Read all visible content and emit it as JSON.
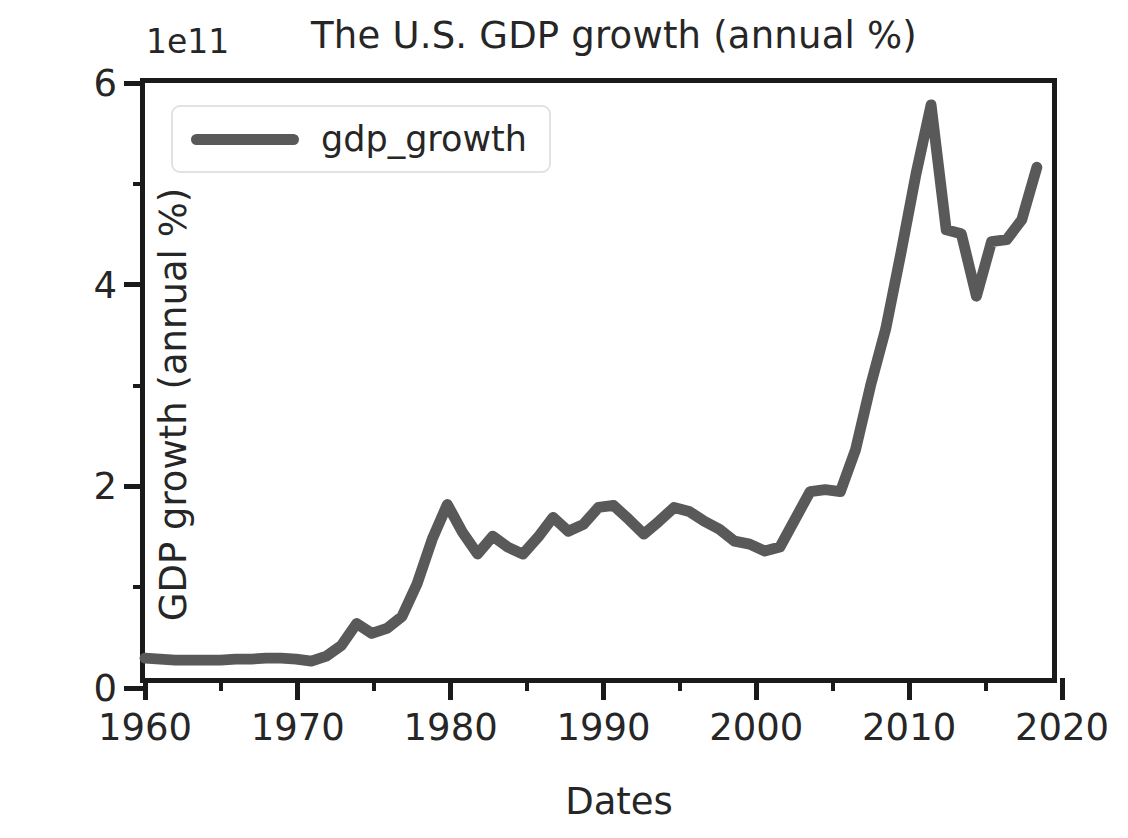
{
  "chart_data": {
    "type": "line",
    "title": "The U.S. GDP growth (annual %)",
    "xlabel": "Dates",
    "ylabel": "GDP growth (annual %)",
    "y_offset_text": "1e11",
    "y_scale_factor": 100000000000.0,
    "xlim": [
      1960,
      2020
    ],
    "ylim": [
      0,
      6
    ],
    "grid": false,
    "legend_position": "upper left",
    "x_ticks_major": [
      1960,
      1970,
      1980,
      1990,
      2000,
      2010,
      2020
    ],
    "x_ticks_minor": [
      1965,
      1975,
      1985,
      1995,
      2005,
      2015
    ],
    "y_ticks_major": [
      0,
      2,
      4,
      6
    ],
    "y_ticks_minor": [
      1,
      3,
      5
    ],
    "line_color": "#595959",
    "line_width_px": 11,
    "series": [
      {
        "name": "gdp_growth",
        "x": [
          1960,
          1961,
          1962,
          1963,
          1964,
          1965,
          1966,
          1967,
          1968,
          1969,
          1970,
          1971,
          1972,
          1973,
          1974,
          1975,
          1976,
          1977,
          1978,
          1979,
          1980,
          1981,
          1982,
          1983,
          1984,
          1985,
          1986,
          1987,
          1988,
          1989,
          1990,
          1991,
          1992,
          1993,
          1994,
          1995,
          1996,
          1997,
          1998,
          1999,
          2000,
          2001,
          2002,
          2003,
          2004,
          2005,
          2006,
          2007,
          2008,
          2009,
          2010,
          2011,
          2012,
          2013,
          2014,
          2015,
          2016,
          2017,
          2018,
          2019
        ],
        "values": [
          0.2,
          0.19,
          0.18,
          0.18,
          0.18,
          0.18,
          0.19,
          0.19,
          0.2,
          0.2,
          0.19,
          0.17,
          0.22,
          0.33,
          0.55,
          0.45,
          0.5,
          0.62,
          0.95,
          1.4,
          1.75,
          1.47,
          1.25,
          1.43,
          1.32,
          1.25,
          1.42,
          1.62,
          1.48,
          1.55,
          1.72,
          1.74,
          1.6,
          1.45,
          1.58,
          1.72,
          1.68,
          1.58,
          1.5,
          1.38,
          1.35,
          1.28,
          1.32,
          1.6,
          1.88,
          1.9,
          1.88,
          2.3,
          2.95,
          3.52,
          4.28,
          5.08,
          5.78,
          4.52,
          4.48,
          3.85,
          4.4,
          4.42,
          4.62,
          5.15
        ]
      }
    ]
  },
  "legend": {
    "label": "gdp_growth"
  }
}
